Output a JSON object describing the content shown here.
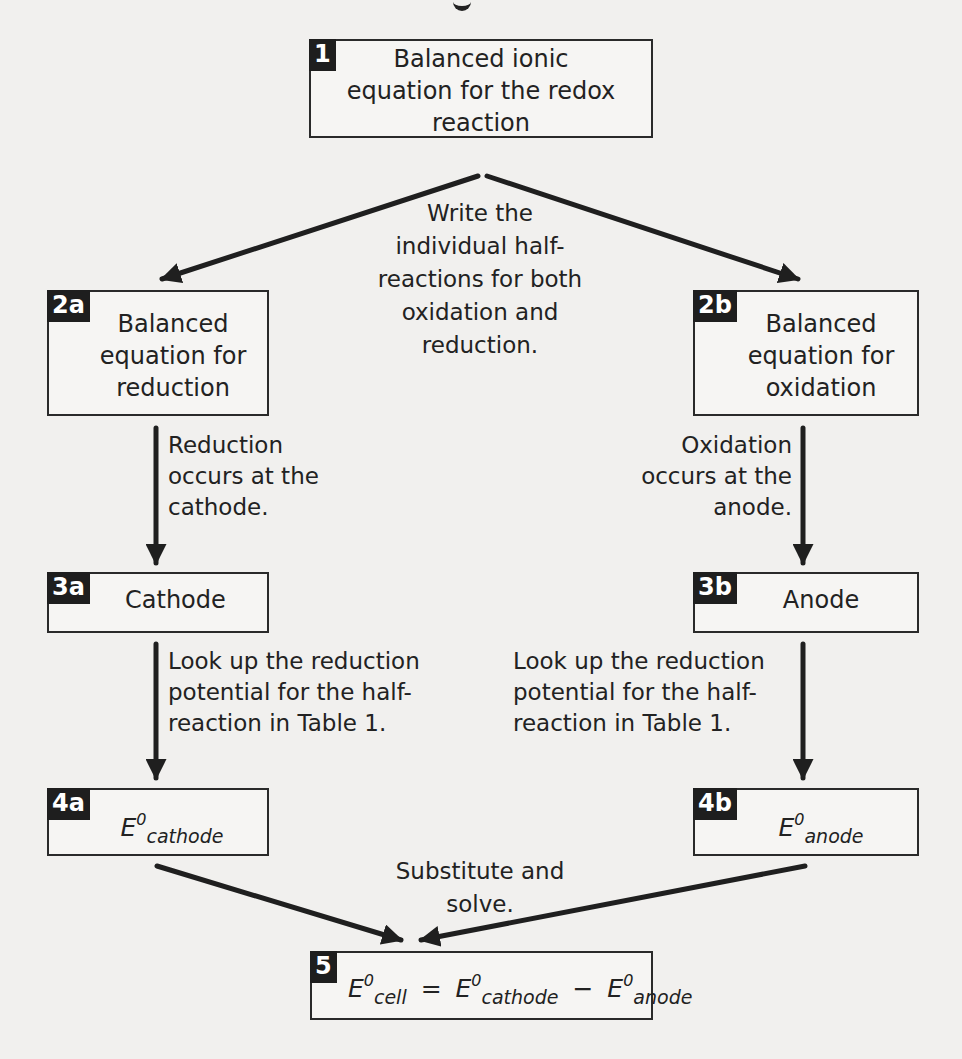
{
  "diagram": {
    "type": "flowchart",
    "topic": "Calculating standard cell potential",
    "cut_off_title_fragment": "g",
    "nodes": {
      "n1": {
        "badge": "1",
        "lines": [
          "Balanced ionic",
          "equation for the redox",
          "reaction"
        ]
      },
      "n2a": {
        "badge": "2a",
        "lines": [
          "Balanced",
          "equation for",
          "reduction"
        ]
      },
      "n2b": {
        "badge": "2b",
        "lines": [
          "Balanced",
          "equation for",
          "oxidation"
        ]
      },
      "n3a": {
        "badge": "3a",
        "text": "Cathode"
      },
      "n3b": {
        "badge": "3b",
        "text": "Anode"
      },
      "n4a": {
        "badge": "4a",
        "symbol": "E",
        "sup": "0",
        "sub": "cathode"
      },
      "n4b": {
        "badge": "4b",
        "symbol": "E",
        "sup": "0",
        "sub": "anode"
      },
      "n5": {
        "badge": "5",
        "lhs": {
          "symbol": "E",
          "sup": "0",
          "sub": "cell"
        },
        "eq": "=",
        "t1": {
          "symbol": "E",
          "sup": "0",
          "sub": "cathode"
        },
        "minus": "−",
        "t2": {
          "symbol": "E",
          "sup": "0",
          "sub": "anode"
        }
      }
    },
    "edge_labels": {
      "split": [
        "Write the",
        "individual half-",
        "reactions for both",
        "oxidation and",
        "reduction."
      ],
      "reduction": [
        "Reduction",
        "occurs at the",
        "cathode."
      ],
      "oxidation": [
        "Oxidation",
        "occurs at the",
        "anode."
      ],
      "lookup_left": [
        "Look up the reduction",
        "potential for the half-",
        "reaction in Table 1."
      ],
      "lookup_right": [
        "Look up the reduction",
        "potential for the half-",
        "reaction in Table 1."
      ],
      "merge": [
        "Substitute and",
        "solve."
      ]
    },
    "edges": [
      {
        "from": "1",
        "to": "2a"
      },
      {
        "from": "1",
        "to": "2b"
      },
      {
        "from": "2a",
        "to": "3a"
      },
      {
        "from": "2b",
        "to": "3b"
      },
      {
        "from": "3a",
        "to": "4a"
      },
      {
        "from": "3b",
        "to": "4b"
      },
      {
        "from": "4a",
        "to": "5"
      },
      {
        "from": "4b",
        "to": "5"
      }
    ]
  }
}
